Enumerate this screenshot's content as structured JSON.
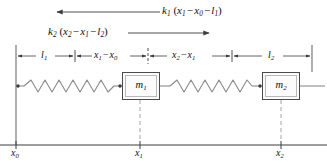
{
  "figure": {
    "type": "mechanical-schematic"
  },
  "forces": [
    {
      "id": "force-k1",
      "symbol": "k",
      "sub": "1",
      "expr_terms": [
        "x",
        "1",
        "x",
        "0",
        "l",
        "1"
      ],
      "text": "k1 (x1 - x0 - l1)",
      "arrow_direction": "left",
      "arrow_x_start": 160,
      "arrow_x_end": 55,
      "arrow_y": 12
    },
    {
      "id": "force-k2",
      "symbol": "k",
      "sub": "2",
      "text": "k2 (x2 - x1 - l2)",
      "arrow_direction": "right",
      "arrow_x_start": 128,
      "arrow_x_end": 211,
      "arrow_y": 33
    }
  ],
  "dimensions": [
    {
      "id": "dim-l1",
      "label": "l1",
      "x_start": 16,
      "x_end": 75,
      "center": 45
    },
    {
      "id": "dim-x1-x0",
      "label": "x1 - x0",
      "x_start": 75,
      "x_end": 148,
      "center": 111
    },
    {
      "id": "dim-x2-x1",
      "label": "x2 - x1",
      "x_start": 148,
      "x_end": 232,
      "center": 190
    },
    {
      "id": "dim-l2",
      "label": "l2",
      "x_start": 232,
      "x_end": 312,
      "center": 272
    }
  ],
  "dimension_row_y": 56,
  "masses": [
    {
      "id": "mass-m1",
      "label": "m1",
      "symbol": "m",
      "sub": "1",
      "x": 122,
      "y": 72,
      "width": 38,
      "height": 28
    },
    {
      "id": "mass-m2",
      "label": "m2",
      "symbol": "m",
      "sub": "2",
      "x": 262,
      "y": 72,
      "width": 38,
      "height": 28
    }
  ],
  "springs": [
    {
      "id": "spring-k1",
      "x_start": 20,
      "x_end": 122,
      "y": 86,
      "coils": 7
    },
    {
      "id": "spring-k2",
      "x_start": 160,
      "x_end": 262,
      "y": 86,
      "coils": 7
    }
  ],
  "axis": {
    "id": "position-axis",
    "y": 145,
    "x_start": 0,
    "x_end": 327,
    "ticks": [
      {
        "id": "tick-x0",
        "label": "x0",
        "symbol": "x",
        "sub": "0",
        "x": 16
      },
      {
        "id": "tick-x1",
        "label": "x1",
        "symbol": "x",
        "sub": "1",
        "x": 140
      },
      {
        "id": "tick-x2",
        "label": "x2",
        "symbol": "x",
        "sub": "2",
        "x": 281
      }
    ]
  },
  "wall": {
    "id": "left-wall",
    "x": 16,
    "y_top": 45,
    "y_bottom": 145
  },
  "right_marker": {
    "id": "right-reference-line",
    "x": 312,
    "y_top": 45,
    "y_bottom": 72
  },
  "colors": {
    "stroke": "#3c3c3c",
    "light_stroke": "#9a9a9a",
    "spring": "#8a8a8a",
    "box_fill": "#fbfbfb",
    "box_border": "#4a4a4a",
    "text": "#111111",
    "background": "#ffffff"
  },
  "symbols": {
    "minus": "−",
    "paren_open": "(",
    "paren_close": ")"
  }
}
